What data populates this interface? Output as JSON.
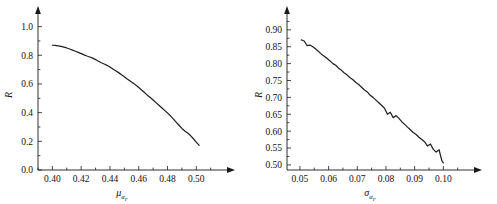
{
  "figure": {
    "title": "",
    "panels": [
      "left",
      "right"
    ]
  },
  "left": {
    "ylabel": "R",
    "xlabel_base": "μ",
    "xlabel_sub": "α",
    "xlabel_subsub": "F",
    "xticklabels": [
      "0.40",
      "0.42",
      "0.44",
      "0.46",
      "0.48",
      "0.50"
    ],
    "yticklabels": [
      "0.0",
      "0.2",
      "0.4",
      "0.6",
      "0.8",
      "1.0"
    ]
  },
  "right": {
    "ylabel": "R",
    "xlabel_base": "σ",
    "xlabel_sub": "α",
    "xlabel_subsub": "F",
    "xticklabels": [
      "0.05",
      "0.06",
      "0.07",
      "0.08",
      "0.09",
      "0.10"
    ],
    "yticklabels": [
      "0.50",
      "0.55",
      "0.60",
      "0.65",
      "0.70",
      "0.75",
      "0.80",
      "0.85",
      "0.90"
    ]
  },
  "chart_data": [
    {
      "type": "line",
      "panel": "left",
      "title": "",
      "xlabel": "μ_αF",
      "ylabel": "R",
      "xlim": [
        0.39,
        0.513
      ],
      "ylim": [
        0.0,
        1.06
      ],
      "xticks": [
        0.4,
        0.42,
        0.44,
        0.46,
        0.48,
        0.5
      ],
      "yticks": [
        0.0,
        0.2,
        0.4,
        0.6,
        0.8,
        1.0
      ],
      "grid": false,
      "legend": "none",
      "series": [
        {
          "name": "R",
          "x": [
            0.4,
            0.402,
            0.404,
            0.406,
            0.408,
            0.41,
            0.412,
            0.414,
            0.416,
            0.418,
            0.42,
            0.422,
            0.424,
            0.426,
            0.428,
            0.43,
            0.432,
            0.434,
            0.436,
            0.438,
            0.44,
            0.442,
            0.444,
            0.446,
            0.448,
            0.45,
            0.452,
            0.454,
            0.456,
            0.458,
            0.46,
            0.462,
            0.464,
            0.466,
            0.468,
            0.47,
            0.472,
            0.474,
            0.476,
            0.478,
            0.48,
            0.482,
            0.484,
            0.486,
            0.488,
            0.49,
            0.492,
            0.494,
            0.496,
            0.498,
            0.5,
            0.502
          ],
          "y": [
            0.87,
            0.869,
            0.866,
            0.862,
            0.857,
            0.851,
            0.844,
            0.836,
            0.828,
            0.82,
            0.812,
            0.803,
            0.795,
            0.788,
            0.78,
            0.77,
            0.758,
            0.748,
            0.739,
            0.73,
            0.718,
            0.705,
            0.692,
            0.679,
            0.665,
            0.65,
            0.634,
            0.62,
            0.606,
            0.592,
            0.575,
            0.558,
            0.54,
            0.522,
            0.505,
            0.488,
            0.47,
            0.452,
            0.434,
            0.416,
            0.398,
            0.378,
            0.356,
            0.334,
            0.312,
            0.29,
            0.272,
            0.258,
            0.24,
            0.218,
            0.195,
            0.172
          ]
        }
      ]
    },
    {
      "type": "line",
      "panel": "right",
      "title": "",
      "xlabel": "σ_αF",
      "ylabel": "R",
      "xlim": [
        0.0455,
        0.1065
      ],
      "ylim": [
        0.485,
        0.935
      ],
      "xticks": [
        0.05,
        0.06,
        0.07,
        0.08,
        0.09,
        0.1
      ],
      "yticks": [
        0.5,
        0.55,
        0.6,
        0.65,
        0.7,
        0.75,
        0.8,
        0.85,
        0.9
      ],
      "grid": false,
      "legend": "none",
      "series": [
        {
          "name": "R",
          "x": [
            0.0505,
            0.0515,
            0.0525,
            0.0535,
            0.0545,
            0.0555,
            0.0565,
            0.0575,
            0.0585,
            0.0595,
            0.0605,
            0.0615,
            0.0625,
            0.0635,
            0.0645,
            0.0655,
            0.0665,
            0.0675,
            0.0685,
            0.0695,
            0.0705,
            0.0715,
            0.0725,
            0.0735,
            0.0745,
            0.0755,
            0.0765,
            0.0775,
            0.0785,
            0.0795,
            0.0805,
            0.0815,
            0.0825,
            0.0835,
            0.0845,
            0.0855,
            0.0865,
            0.0875,
            0.0885,
            0.0895,
            0.0905,
            0.0915,
            0.0925,
            0.0935,
            0.0945,
            0.0955,
            0.0965,
            0.0975,
            0.0985,
            0.0995,
            0.1
          ],
          "y": [
            0.87,
            0.867,
            0.853,
            0.855,
            0.85,
            0.843,
            0.836,
            0.828,
            0.822,
            0.815,
            0.808,
            0.8,
            0.795,
            0.786,
            0.78,
            0.772,
            0.766,
            0.758,
            0.752,
            0.744,
            0.738,
            0.73,
            0.722,
            0.716,
            0.706,
            0.7,
            0.692,
            0.684,
            0.676,
            0.668,
            0.65,
            0.656,
            0.64,
            0.646,
            0.638,
            0.628,
            0.62,
            0.612,
            0.604,
            0.596,
            0.59,
            0.582,
            0.575,
            0.568,
            0.556,
            0.562,
            0.546,
            0.538,
            0.545,
            0.512,
            0.506
          ]
        }
      ]
    }
  ]
}
